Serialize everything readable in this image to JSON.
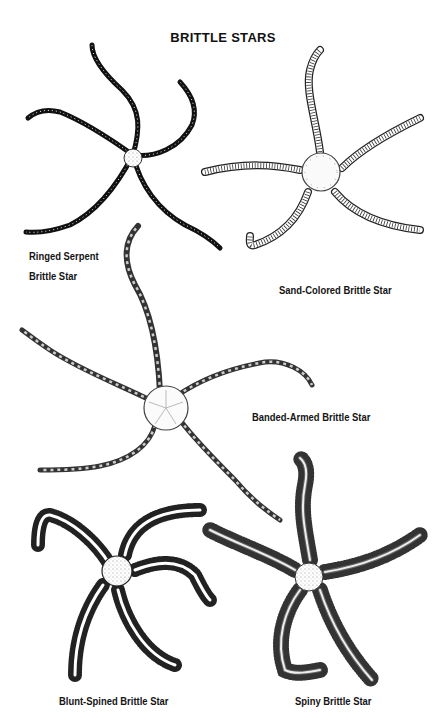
{
  "page": {
    "title": "BRITTLE STARS"
  },
  "species": [
    {
      "name_line1": "Ringed Serpent",
      "name_line2": "Brittle Star",
      "style": "dark-banded"
    },
    {
      "name": "Sand-Colored Brittle Star",
      "style": "segmented-outline"
    },
    {
      "name": "Banded-Armed Brittle Star",
      "style": "banded-long"
    },
    {
      "name": "Blunt-Spined Brittle Star",
      "style": "blunt-spines"
    },
    {
      "name": "Spiny Brittle Star",
      "style": "long-spines"
    }
  ],
  "colors": {
    "ink": "#111111",
    "paper": "#ffffff"
  }
}
